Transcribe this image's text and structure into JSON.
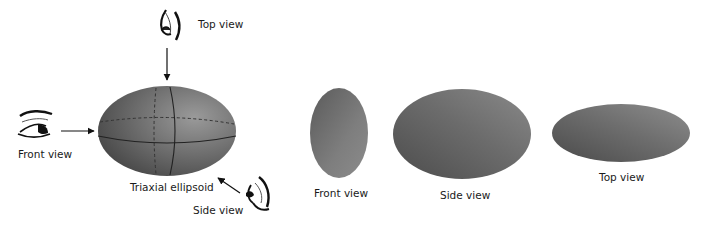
{
  "diagram": {
    "main_figure": {
      "title": "Triaxial ellipsoid",
      "viewpoints": [
        {
          "id": "top",
          "label": "Top view",
          "direction": "from above"
        },
        {
          "id": "front",
          "label": "Front view",
          "direction": "from left"
        },
        {
          "id": "side",
          "label": "Side view",
          "direction": "from lower right"
        }
      ]
    },
    "projections": [
      {
        "id": "front",
        "label": "Front view",
        "shape": "tall narrow ellipse"
      },
      {
        "id": "side",
        "label": "Side view",
        "shape": "wide ellipse"
      },
      {
        "id": "top",
        "label": "Top view",
        "shape": "flat elongated ellipse"
      }
    ],
    "colors": {
      "fill_dark": "#4a4a4a",
      "fill_light": "#8a8a8a",
      "line": "#222222",
      "text": "#1a1a1a"
    }
  }
}
